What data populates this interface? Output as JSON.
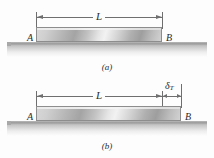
{
  "figure": {
    "background_color": "#fdfdfd",
    "line_color": "#6f6f6f",
    "bar_border_color": "#8d8d8d",
    "text_color": "#2b2b2b"
  },
  "panel_a": {
    "caption": "(a)",
    "length_label": "L",
    "left_node_label": "A",
    "right_node_label": "B",
    "bar": {
      "left_px": 36,
      "right_px": 162,
      "top_px": 27,
      "height_px": 15
    },
    "dimension": {
      "left_px": 36,
      "right_px": 162,
      "y_px": 17
    }
  },
  "panel_b": {
    "caption": "(b)",
    "length_label": "L",
    "delta_symbol": "δ",
    "delta_subscript": "T",
    "left_node_label": "A",
    "right_node_label": "B",
    "bar": {
      "left_px": 36,
      "right_px": 181,
      "top_px": 27,
      "height_px": 15
    },
    "dimension_length": {
      "left_px": 36,
      "right_px": 162,
      "y_px": 17
    },
    "dimension_delta": {
      "left_px": 162,
      "right_px": 181,
      "y_px": 17
    }
  }
}
